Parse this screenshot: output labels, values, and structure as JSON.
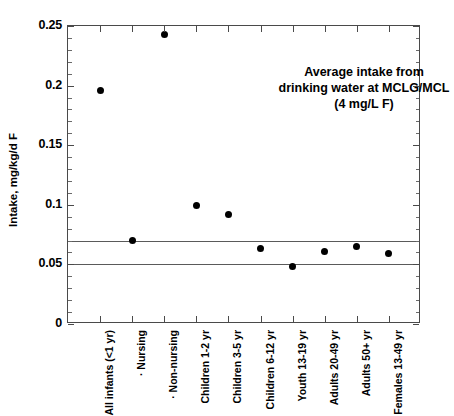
{
  "chart_data": {
    "type": "scatter",
    "title": "",
    "xlabel": "",
    "ylabel": "Intake, mg/kg/d F",
    "ylim": [
      0,
      0.25
    ],
    "ytick_labels": [
      "0",
      "0.05",
      "0.1",
      "0.15",
      "0.2",
      "0.25"
    ],
    "ytick_values": [
      0,
      0.05,
      0.1,
      0.15,
      0.2,
      0.25
    ],
    "yminor_step": 0.01,
    "grid": false,
    "legend": "none",
    "categories": [
      "All infants (<1 yr)",
      "· Nursing",
      "· Non-nursing",
      "Children 1-2 yr",
      "Children 3-5 yr",
      "Children 6-12 yr",
      "Youth 13-19 yr",
      "Adults 20-49 yr",
      "Adults 50+ yr",
      "Females 13-49 yr"
    ],
    "values": [
      0.196,
      0.07,
      0.243,
      0.099,
      0.092,
      0.063,
      0.048,
      0.061,
      0.065,
      0.059
    ],
    "reference_lines": [
      {
        "name": "upper-reference-line",
        "value": 0.07
      },
      {
        "name": "lower-reference-line",
        "value": 0.05
      }
    ],
    "annotations": [
      {
        "name": "mclg-mcl-annotation",
        "lines": [
          "Average intake from",
          "drinking water at MCLG/MCL",
          "(4 mg/L F)"
        ]
      }
    ],
    "marker_color": "#000000",
    "axis_color": "#4a4a4a"
  }
}
